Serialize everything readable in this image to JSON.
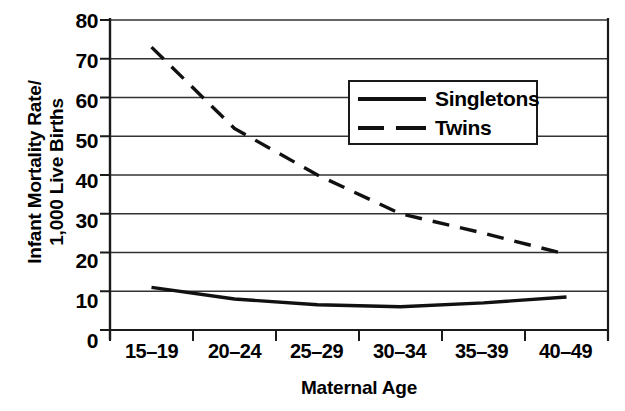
{
  "chart_data": {
    "type": "line",
    "title": "",
    "xlabel": "Maternal Age",
    "ylabel_line1": "Infant Mortality Rate/",
    "ylabel_line2": "1,000 Live Births",
    "categories": [
      "15–19",
      "20–24",
      "25–29",
      "30–34",
      "35–39",
      "40–49"
    ],
    "ylim": [
      0,
      80
    ],
    "yticks": [
      0,
      10,
      20,
      30,
      40,
      50,
      60,
      70,
      80
    ],
    "grid": "horizontal",
    "legend_position": "upper-right-inside",
    "series": [
      {
        "name": "Singletons",
        "style": "solid",
        "color": "#111111",
        "values": [
          11,
          8,
          6.5,
          6,
          7,
          8.5
        ]
      },
      {
        "name": "Twins",
        "style": "dashed",
        "color": "#111111",
        "values": [
          73,
          52,
          40,
          30,
          25,
          19.5
        ]
      }
    ]
  },
  "axes": {
    "ytick_labels": [
      "80",
      "70",
      "60",
      "50",
      "40",
      "30",
      "20",
      "10",
      "0"
    ],
    "xtick_labels": [
      "15–19",
      "20–24",
      "25–29",
      "30–34",
      "35–39",
      "40–49"
    ]
  },
  "legend": {
    "items": [
      {
        "label": "Singletons",
        "style": "solid"
      },
      {
        "label": "Twins",
        "style": "dashed"
      }
    ]
  },
  "colors": {
    "line": "#111111",
    "grid": "#333333",
    "axis": "#1a1a1a",
    "background": "#ffffff"
  }
}
